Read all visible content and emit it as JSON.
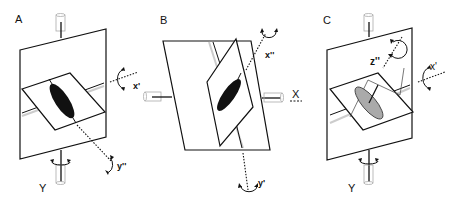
{
  "figure": {
    "panels": [
      {
        "id": "A",
        "label": "A",
        "axes": {
          "vertical": "Y",
          "rotation_1": "x'",
          "rotation_2": "y''"
        },
        "ellipse_fill": "#111111"
      },
      {
        "id": "B",
        "label": "B",
        "axes": {
          "horizontal": "X",
          "rotation_1": "x''",
          "rotation_2": "y'"
        },
        "ellipse_fill": "#111111"
      },
      {
        "id": "C",
        "label": "C",
        "axes": {
          "vertical": "Y",
          "rotation_1": "x'",
          "rotation_2": "z''"
        },
        "ellipse_fill": "#aaaaaa"
      }
    ]
  }
}
